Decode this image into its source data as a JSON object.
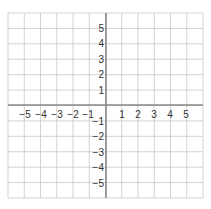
{
  "chart_data": {
    "type": "coordinate-grid",
    "title": "",
    "xlabel": "",
    "ylabel": "",
    "xlim": [
      -6,
      6
    ],
    "ylim": [
      -6,
      6
    ],
    "grid": true,
    "x_tick_labels": [
      "−5",
      "−4",
      "−3",
      "−2",
      "−1",
      "1",
      "2",
      "3",
      "4",
      "5"
    ],
    "y_tick_labels": [
      "5",
      "4",
      "3",
      "2",
      "1",
      "−1",
      "−2",
      "−3",
      "−4",
      "−5"
    ],
    "x_ticks": [
      -5,
      -4,
      -3,
      -2,
      -1,
      1,
      2,
      3,
      4,
      5
    ],
    "y_ticks": [
      5,
      4,
      3,
      2,
      1,
      -1,
      -2,
      -3,
      -4,
      -5
    ],
    "series": []
  },
  "colors": {
    "grid": "#c8c8c8",
    "axis": "#888888",
    "label": "#333333",
    "background": "#ffffff"
  }
}
